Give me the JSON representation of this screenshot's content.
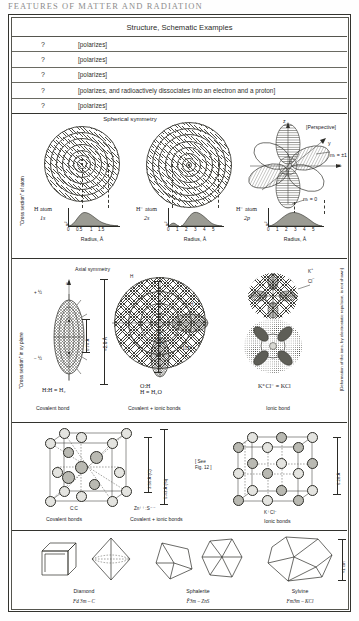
{
  "running_head": "FEATURES OF MATTER AND RADIATION",
  "table": {
    "column_header": "Structure, Schematic Examples",
    "rows": [
      {
        "mark": "?",
        "note": "[polarizes]"
      },
      {
        "mark": "?",
        "note": "[polarizes]"
      },
      {
        "mark": "?",
        "note": "[polarizes]"
      },
      {
        "mark": "?",
        "note": "[polarizes, and radioactively dissociates into an electron and a proton]"
      },
      {
        "mark": "?",
        "note": "[polarizes]"
      }
    ]
  },
  "panel_atoms": {
    "title": "Spherical symmetry",
    "side_label": "\"Cross section\" of atom",
    "perspective_label": "[Perspective]",
    "axis_label": "Radius, Å",
    "ordinate_label": "ψ²",
    "items": [
      {
        "name": "H atom",
        "orbital": "1s",
        "ticks": [
          "0",
          "0.5",
          "1",
          "1.5"
        ],
        "curve_peak_at": 0.53
      },
      {
        "name": "H⁻ atom",
        "orbital": "2s",
        "ticks": [
          "0",
          "1",
          "2",
          "3",
          "4",
          "5"
        ],
        "curve_peak_at": 2.8
      },
      {
        "name": "H⁻ atom",
        "orbital": "2p",
        "ticks": [
          "0",
          "1",
          "2",
          "3",
          "4",
          "5"
        ],
        "curve_peak_at": 3.0
      }
    ],
    "perspective_axes": [
      "z",
      "y",
      "x"
    ],
    "quantum_labels": [
      "mₗ = ±1",
      "mₗ = 0"
    ]
  },
  "panel_bonds": {
    "side_label": "\"Cross section\" in xy plane",
    "axial_title": "Axial symmetry",
    "spin_up": "+ ½",
    "spin_down": "− ½",
    "spin_symbol": "sₗ",
    "right_note": "[Deformation of the ions, by electrostatic repulsion, is not shown]",
    "items": [
      {
        "formula": "H:H ≡ H₂",
        "caption": "Covalent bond",
        "dims": [
          "0.74 Å",
          "≈2.8 Å"
        ]
      },
      {
        "formula": "O:H\nH ≡ H₂O",
        "caption": "Covalent + ionic bonds",
        "dims": [
          "≈2.7 Å"
        ],
        "angle": "105°"
      },
      {
        "formula": "K⁺Cl⁻ ≡ KCl",
        "caption": "Ionic bond",
        "dims": []
      }
    ]
  },
  "panel_crystals": {
    "see_note": "[ See\nFig. 12 ]",
    "cells": [
      {
        "bond_label": "C:C",
        "caption": "Covalent bonds",
        "dims": [
          "3.56 Å (C)",
          "5.43 Å (Si)"
        ]
      },
      {
        "bond_label": "Zn⁺⁺:S⁻⁻",
        "caption": "Covalent + ionic bonds",
        "dims": []
      },
      {
        "bond_label": "K⁺Cl⁻",
        "caption": "Ionic bonds",
        "dims": [
          "6.28 Å"
        ]
      }
    ]
  },
  "panel_habits": {
    "scale_label": "≈1 cm",
    "minerals": [
      {
        "name": "Diamond",
        "spacegroup": "Fd 3m – C"
      },
      {
        "name": "Sphalerite",
        "spacegroup": "F̄3m – ZnS"
      },
      {
        "name": "Sylvine",
        "spacegroup": "Fm3m – KCl"
      }
    ]
  },
  "colors": {
    "ink": "#23231f",
    "rule": "#33332e",
    "hatch": "#4a4a44",
    "paper": "#fefefe"
  }
}
